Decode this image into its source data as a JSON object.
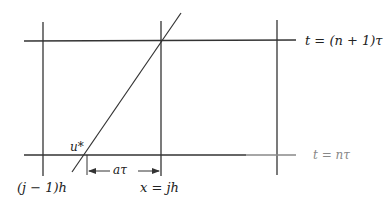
{
  "diagram": {
    "labels": {
      "top_time_level": "t = (n + 1)τ",
      "bottom_time_level": "t = nτ",
      "foot_point": "u*",
      "displacement": "aτ",
      "left_grid_x": "(j − 1)h",
      "center_grid_x": "x = jh"
    },
    "colors": {
      "line": "#333333",
      "faded_line": "#9a9a9a",
      "text": "#222222"
    },
    "geometry": {
      "vertical_lines_x": [
        43,
        161,
        277
      ],
      "horizontal_lines_y": [
        41,
        155
      ],
      "characteristic_line": {
        "x1": 181,
        "y1": 13,
        "x2": 72,
        "y2": 172
      },
      "foot_point_x": 87,
      "arrow_y": 170
    }
  }
}
